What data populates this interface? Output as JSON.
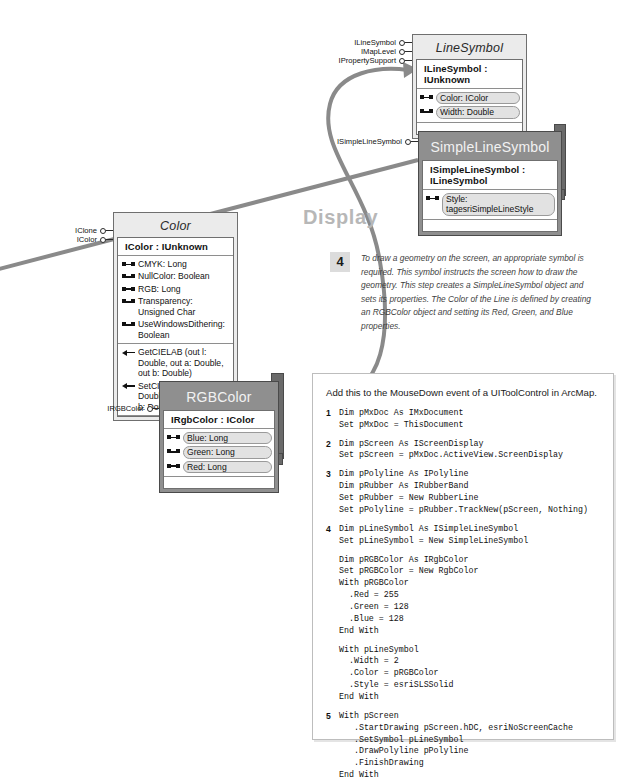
{
  "section": {
    "heading": "Display"
  },
  "step_note": {
    "number": "4",
    "text": "To draw a geometry on the screen, an appropriate symbol is required. This symbol instructs the screen how to draw the geometry. This step creates a SimpleLineSymbol object and sets its properties. The Color of the Line is defined by creating an RGBColor object and setting its Red, Green, and Blue properties."
  },
  "classes": {
    "line_symbol": {
      "name": "LineSymbol",
      "kind": "abstract-class",
      "interface": "ILineSymbol : IUnknown",
      "members": [
        {
          "glyph": "property",
          "text": "Color: IColor"
        },
        {
          "glyph": "property",
          "text": "Width: Double"
        }
      ],
      "lollipops": [
        "ILineSymbol",
        "IMapLevel",
        "IPropertySupport"
      ]
    },
    "simple_line_symbol": {
      "name": "SimpleLineSymbol",
      "kind": "coclass",
      "interface": "ISimpleLineSymbol : ILineSymbol",
      "members": [
        {
          "glyph": "property",
          "text": "Style: tagesriSimpleLineStyle"
        }
      ],
      "lollipops": [
        "ISimpleLineSymbol"
      ]
    },
    "color": {
      "name": "Color",
      "kind": "abstract-class",
      "interface": "IColor : IUnknown",
      "properties": [
        {
          "glyph": "property",
          "text": "CMYK: Long"
        },
        {
          "glyph": "property",
          "text": "NullColor: Boolean"
        },
        {
          "glyph": "property",
          "text": "RGB: Long"
        },
        {
          "glyph": "property",
          "text": "Transparency: Unsigned Char"
        },
        {
          "glyph": "property",
          "text": "UseWindowsDithering: Boolean"
        }
      ],
      "methods": [
        {
          "glyph": "method",
          "text": "GetCIELAB (out l: Double, out a: Double, out b: Double)"
        },
        {
          "glyph": "method",
          "text": "SetCIELAB (in l: Double, in a: Double, in b: Double)"
        }
      ],
      "lollipops": [
        "IClone",
        "IColor"
      ]
    },
    "rgb_color": {
      "name": "RGBColor",
      "kind": "coclass",
      "interface": "IRgbColor : IColor",
      "members": [
        {
          "glyph": "property",
          "text": "Blue: Long"
        },
        {
          "glyph": "property",
          "text": "Green: Long"
        },
        {
          "glyph": "property",
          "text": "Red: Long"
        }
      ],
      "lollipops": [
        "IRGBColor"
      ]
    }
  },
  "code_panel": {
    "header": "Add this to the MouseDown event of a UIToolControl in ArcMap.",
    "blocks": [
      {
        "number": "1",
        "code": "Dim pMxDoc As IMxDocument\nSet pMxDoc = ThisDocument"
      },
      {
        "number": "2",
        "code": "Dim pScreen As IScreenDisplay\nSet pScreen = pMxDoc.ActiveView.ScreenDisplay"
      },
      {
        "number": "3",
        "code": "Dim pPolyline As IPolyline\nDim pRubber As IRubberBand\nSet pRubber = New RubberLine\nSet pPolyline = pRubber.TrackNew(pScreen, Nothing)"
      },
      {
        "number": "4",
        "code": "Dim pLineSymbol As ISimpleLineSymbol\nSet pLineSymbol = New SimpleLineSymbol"
      },
      {
        "number": "",
        "code": "Dim pRGBColor As IRgbColor\nSet pRGBColor = New RgbColor\nWith pRGBColor\n  .Red = 255\n  .Green = 128\n  .Blue = 128\nEnd With"
      },
      {
        "number": "",
        "code": "With pLineSymbol\n  .Width = 2\n  .Color = pRGBColor\n  .Style = esriSLSSolid\nEnd With"
      },
      {
        "number": "5",
        "code": "With pScreen\n   .StartDrawing pScreen.hDC, esriNoScreenCache\n   .SetSymbol pLineSymbol\n   .DrawPolyline pPolyline\n   .FinishDrawing\nEnd With"
      }
    ]
  },
  "colors": {
    "abstract_fill": "#ebebeb",
    "coclass_fill": "#8f8f8f",
    "coclass_shadow": "#6a6a6a",
    "wire": "#8a8a8a",
    "heading": "#b7b7b7",
    "step_badge": "#dcdcdc"
  }
}
